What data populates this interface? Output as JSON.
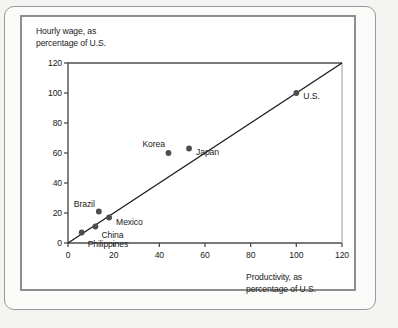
{
  "chart_data": {
    "type": "scatter",
    "title": "",
    "xlabel": "Productivity, as\npercentage of U.S.",
    "ylabel": "Hourly wage, as\npercentage of U.S.",
    "xlim": [
      0,
      120
    ],
    "ylim": [
      0,
      120
    ],
    "xticks": [
      "0",
      "20",
      "40",
      "60",
      "80",
      "100",
      "120"
    ],
    "yticks": [
      "0",
      "20",
      "40",
      "60",
      "80",
      "100",
      "120"
    ],
    "grid": false,
    "legend": "none",
    "reference_line": {
      "name": "45-degree line",
      "from": [
        0,
        0
      ],
      "to": [
        120,
        120
      ]
    },
    "points": [
      {
        "label": "Philippines",
        "x": 6,
        "y": 7,
        "label_dx": 6,
        "label_dy": 11
      },
      {
        "label": "China",
        "x": 12,
        "y": 11,
        "label_dx": 6,
        "label_dy": 8
      },
      {
        "label": "Mexico",
        "x": 18,
        "y": 17,
        "label_dx": 7,
        "label_dy": 4
      },
      {
        "label": "Brazil",
        "x": 13.5,
        "y": 21,
        "label_dx": -12,
        "label_dy": -8
      },
      {
        "label": "Korea",
        "x": 44,
        "y": 60,
        "label_dx": -12,
        "label_dy": -9
      },
      {
        "label": "Japan",
        "x": 53,
        "y": 63,
        "label_dx": 7,
        "label_dy": 3
      },
      {
        "label": "U.S.",
        "x": 100,
        "y": 100,
        "label_dx": 7,
        "label_dy": 3
      }
    ],
    "marker_color": "#4d4d4d",
    "line_color": "#1a1a1a",
    "axis_color": "#4d4d4d"
  }
}
